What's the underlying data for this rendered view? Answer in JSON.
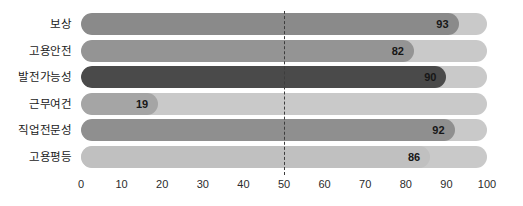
{
  "chart_data": {
    "type": "bar",
    "orientation": "horizontal",
    "title": "",
    "xlabel": "",
    "ylabel": "",
    "categories": [
      "보상",
      "고용안전",
      "발전가능성",
      "근무여건",
      "직업전문성",
      "고용평등"
    ],
    "values": [
      93,
      82,
      90,
      19,
      92,
      86
    ],
    "value_labels": [
      "93",
      "82",
      "90",
      "19",
      "92",
      "86"
    ],
    "xlim": [
      0,
      100
    ],
    "xticks": [
      0,
      10,
      20,
      30,
      40,
      50,
      60,
      70,
      80,
      90,
      100
    ],
    "xtick_labels": [
      "0",
      "10",
      "20",
      "30",
      "40",
      "50",
      "60",
      "70",
      "80",
      "90",
      "100"
    ],
    "grid": false,
    "legend": "none",
    "annotations": [
      {
        "name": "reference-line",
        "type": "vertical-dashed",
        "value": 50,
        "color": "#3d3d3d"
      }
    ],
    "bar_colors": [
      "#8a8a8a",
      "#949494",
      "#4a4a4a",
      "#a5a5a5",
      "#8f8f8f",
      "#c0c0c0"
    ],
    "track_color": "#c9c9c9",
    "value_label_color": "#171717",
    "tick_label_color": "#2b2b2b",
    "category_label_color": "#1a1a1a"
  }
}
